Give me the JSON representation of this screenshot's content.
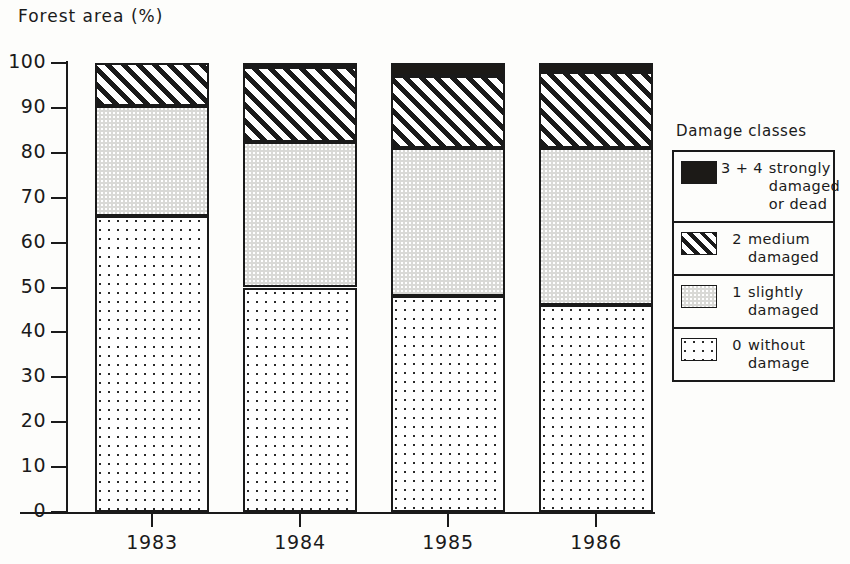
{
  "chart_data": {
    "type": "bar",
    "subtype": "stacked-100-percent",
    "title": "Forest area (%)",
    "xlabel": "",
    "ylabel": "Forest area (%)",
    "ylim": [
      0,
      100
    ],
    "yticks": [
      0,
      10,
      20,
      30,
      40,
      50,
      60,
      70,
      80,
      90,
      100
    ],
    "ytick_labels": [
      "0",
      "10",
      "20",
      "30",
      "40",
      "50",
      "60",
      "70",
      "80",
      "90",
      "100"
    ],
    "grid": false,
    "legend_position": "right",
    "categories": [
      "1983",
      "1984",
      "1985",
      "1986"
    ],
    "series": [
      {
        "name": "0 without damage",
        "key": "class0",
        "values": [
          66.0,
          50.0,
          48.0,
          46.0
        ]
      },
      {
        "name": "1 slightly damaged",
        "key": "class1",
        "values": [
          24.5,
          32.5,
          33.0,
          35.0
        ]
      },
      {
        "name": "2 medium damaged",
        "key": "class2",
        "values": [
          9.5,
          16.5,
          16.0,
          17.0
        ]
      },
      {
        "name": "3 + 4 strongly damaged or dead",
        "key": "class34",
        "values": [
          0.0,
          1.0,
          3.0,
          2.0
        ]
      }
    ],
    "cumulative_tops": {
      "1983": {
        "class0": 66.0,
        "class1": 90.5,
        "class2": 100.0,
        "class34": 100.0
      },
      "1984": {
        "class0": 50.0,
        "class1": 82.5,
        "class2": 99.0,
        "class34": 100.0
      },
      "1985": {
        "class0": 48.0,
        "class1": 81.0,
        "class2": 97.0,
        "class34": 100.0
      },
      "1986": {
        "class0": 46.0,
        "class1": 81.0,
        "class2": 98.0,
        "class34": 100.0
      }
    }
  },
  "legend": {
    "title": "Damage classes",
    "entries": [
      {
        "pattern": "solid-black",
        "code": "3 + 4",
        "description": "strongly\ndamaged\nor dead"
      },
      {
        "pattern": "diagonal-hatch",
        "code": "2",
        "description": "medium\ndamaged"
      },
      {
        "pattern": "light-grey",
        "code": "1",
        "description": "slightly\ndamaged"
      },
      {
        "pattern": "sparse-dots",
        "code": "0",
        "description": "without\ndamage"
      }
    ]
  },
  "colors": {
    "ink": "#1a1a1a",
    "paper": "#fdfdfb",
    "class0_fill": "#ffffff",
    "class1_fill": "#d9d9d6",
    "class2_fill": "#ffffff",
    "class34_fill": "#1c1a17"
  }
}
